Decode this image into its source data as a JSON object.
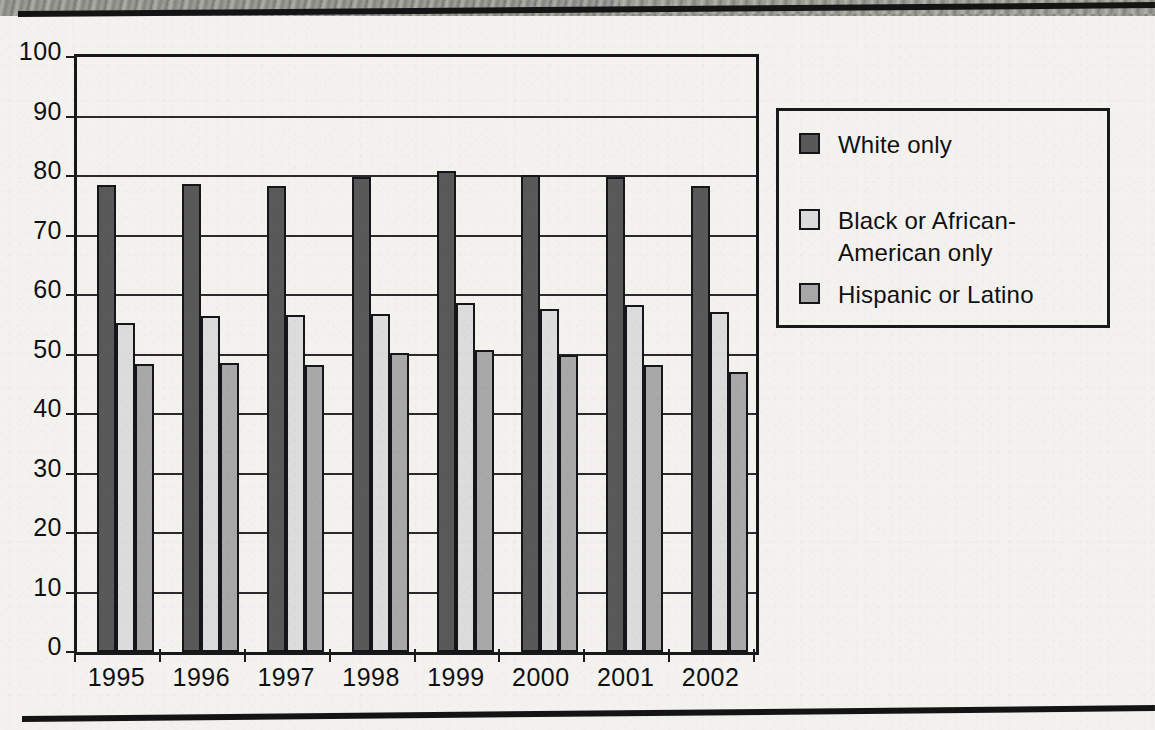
{
  "chart_data": {
    "type": "bar",
    "title": "",
    "xlabel": "",
    "ylabel": "",
    "categories": [
      "1995",
      "1996",
      "1997",
      "1998",
      "1999",
      "2000",
      "2001",
      "2002"
    ],
    "series": [
      {
        "name": "White only",
        "color": "#595959",
        "values": [
          78.5,
          78.7,
          78.4,
          79.8,
          80.8,
          80.1,
          79.9,
          78.3
        ]
      },
      {
        "name": "Black or African-American only",
        "color": "#dcdcdc",
        "values": [
          55.3,
          56.4,
          56.6,
          56.8,
          58.6,
          57.7,
          58.4,
          57.2
        ]
      },
      {
        "name": "Hispanic or Latino",
        "color": "#a8a8a8",
        "values": [
          48.4,
          48.6,
          48.3,
          50.3,
          50.8,
          50.0,
          48.3,
          47.0
        ]
      }
    ],
    "ylim": [
      0,
      100
    ],
    "yticks": [
      0,
      10,
      20,
      30,
      40,
      50,
      60,
      70,
      80,
      90,
      100
    ],
    "ytick_labels": [
      "0",
      "10",
      "20",
      "30",
      "40",
      "50",
      "60",
      "70",
      "80",
      "90",
      "100"
    ],
    "grid": true,
    "legend_position": "right"
  },
  "legend": {
    "items": [
      {
        "label": "White only",
        "color": "#595959"
      },
      {
        "label": "Black or African-American only",
        "color": "#dcdcdc"
      },
      {
        "label": "Hispanic or Latino",
        "color": "#a8a8a8"
      }
    ]
  },
  "colors": {
    "axis": "#18181a",
    "grid": "#2b2b2e",
    "text": "#101012",
    "paper": "#f3f2ef",
    "rule": "#141414"
  }
}
